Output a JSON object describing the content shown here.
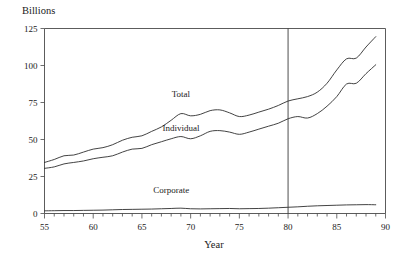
{
  "chart_data": {
    "type": "line",
    "title": "",
    "subtitle": "",
    "ylabel": "Billions",
    "xlabel": "Year",
    "ylim": [
      0,
      125
    ],
    "xlim": [
      55,
      90
    ],
    "grid": false,
    "legend_position": "inline-labels",
    "y_ticks": [
      0,
      25,
      50,
      75,
      100,
      125
    ],
    "y_tick_labels": [
      "0",
      "25",
      "50",
      "75",
      "100",
      "125"
    ],
    "x_ticks": [
      55,
      60,
      65,
      70,
      75,
      80,
      85,
      90
    ],
    "x_tick_labels": [
      "55",
      "60",
      "65",
      "70",
      "75",
      "80",
      "85",
      "90"
    ],
    "x_minor_tick_step": 1,
    "annotations": [
      {
        "name": "reference-line-1980",
        "type": "vline",
        "x": 80,
        "label": ""
      }
    ],
    "x": [
      55,
      56,
      57,
      58,
      59,
      60,
      61,
      62,
      63,
      64,
      65,
      66,
      67,
      68,
      69,
      70,
      71,
      72,
      73,
      74,
      75,
      76,
      77,
      78,
      79,
      80,
      81,
      82,
      83,
      84,
      85,
      86,
      87,
      88,
      89
    ],
    "series": [
      {
        "name": "Total",
        "label": "Total",
        "color": "#2e2e2e",
        "label_x": 69,
        "label_y": 79,
        "values": [
          34.5,
          36.5,
          39.0,
          39.5,
          41.5,
          43.5,
          44.5,
          46.5,
          49.5,
          51.5,
          52.5,
          55.5,
          58.5,
          63.0,
          67.5,
          66.0,
          67.0,
          69.5,
          70.0,
          68.0,
          65.5,
          66.5,
          68.5,
          70.5,
          73.0,
          76.0,
          77.5,
          79.0,
          82.0,
          88.0,
          97.0,
          104.5,
          105.0,
          112.5,
          119.5
        ]
      },
      {
        "name": "Individual",
        "label": "Individual",
        "color": "#2e2e2e",
        "label_x": 69,
        "label_y": 56,
        "values": [
          30.5,
          31.5,
          33.5,
          34.5,
          35.5,
          37.0,
          38.0,
          39.0,
          41.5,
          43.5,
          44.0,
          46.5,
          48.5,
          50.5,
          52.0,
          50.5,
          52.5,
          55.5,
          56.0,
          55.0,
          53.5,
          55.0,
          57.0,
          59.0,
          61.0,
          64.0,
          65.5,
          64.5,
          67.5,
          72.5,
          79.0,
          87.5,
          88.0,
          94.5,
          100.5
        ]
      },
      {
        "name": "Corporate",
        "label": "Corporate",
        "color": "#2e2e2e",
        "label_x": 68,
        "label_y": 14,
        "values": [
          1.8,
          1.9,
          2.0,
          2.0,
          2.1,
          2.2,
          2.3,
          2.5,
          2.7,
          2.8,
          2.9,
          3.0,
          3.2,
          3.4,
          3.6,
          3.2,
          3.1,
          3.2,
          3.3,
          3.4,
          3.2,
          3.3,
          3.4,
          3.6,
          3.9,
          4.2,
          4.5,
          4.9,
          5.2,
          5.4,
          5.6,
          5.8,
          5.9,
          6.0,
          5.9
        ]
      }
    ]
  }
}
